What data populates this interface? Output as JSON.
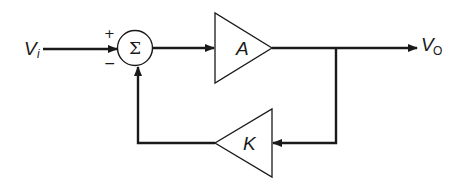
{
  "diagram": {
    "type": "feedback-block-diagram",
    "input_label": "V",
    "input_subscript": "i",
    "output_label": "V",
    "output_subscript": "O",
    "summing_junction": {
      "symbol": "Σ",
      "plus_sign": "+",
      "minus_sign": "−"
    },
    "forward_block": {
      "label": "A"
    },
    "feedback_block": {
      "label": "K"
    },
    "colors": {
      "stroke": "#1a1a1a",
      "background": "#ffffff"
    }
  }
}
